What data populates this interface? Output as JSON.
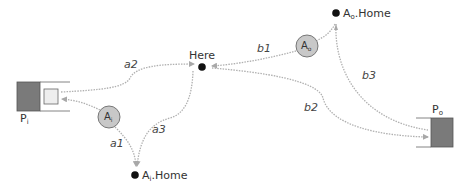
{
  "diagram": {
    "nodes": {
      "here": {
        "label": "Here"
      },
      "ai_home": {
        "label_main": "A",
        "label_sub": "i",
        "label_suffix": ".Home"
      },
      "ao_home": {
        "label_main": "A",
        "label_sub": "o",
        "label_suffix": ".Home"
      },
      "ai": {
        "label_main": "A",
        "label_sub": "i"
      },
      "ao": {
        "label_main": "A",
        "label_sub": "o"
      },
      "pi": {
        "label_main": "P",
        "label_sub": "i"
      },
      "po": {
        "label_main": "P",
        "label_sub": "o"
      }
    },
    "edges": [
      {
        "id": "a1",
        "label": "a1",
        "from": "Ai",
        "to": "Ai.Home"
      },
      {
        "id": "a2",
        "label": "a2",
        "from": "Pi",
        "to": "Here"
      },
      {
        "id": "a3",
        "label": "a3",
        "from": "Here",
        "to": "Ai.Home"
      },
      {
        "id": "b1",
        "label": "b1",
        "from": "Ao.Home",
        "to": "Here"
      },
      {
        "id": "b2",
        "label": "b2",
        "from": "Here",
        "to": "Po"
      },
      {
        "id": "b3",
        "label": "b3",
        "from": "Ao.Home",
        "to": "Po"
      }
    ],
    "colors": {
      "edge": "#b0b0b0",
      "dot": "#111111",
      "circle_fill": "#c8c8c8",
      "circle_stroke": "#777777",
      "port_dark": "#7a7a7a",
      "port_light": "#eeeeee"
    }
  }
}
